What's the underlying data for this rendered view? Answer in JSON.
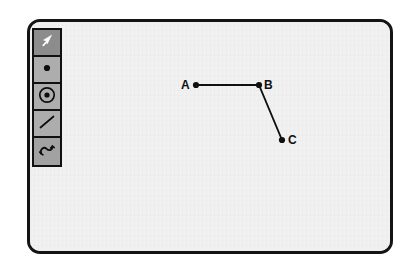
{
  "app": {
    "window_name": "geometry-sketch-window",
    "canvas_name": "drawing-canvas",
    "canvas_bg": "#f1f1f1",
    "border_color": "#141414"
  },
  "toolbar": {
    "name": "tool-palette",
    "active_tool": "select",
    "bg": "#b4b4b4",
    "active_bg": "#8c8c8c",
    "idle_bg": "#adadad",
    "tools": [
      {
        "id": "select",
        "icon": "arrow-cursor-icon",
        "label": "Select",
        "active": true
      },
      {
        "id": "point",
        "icon": "point-icon",
        "label": "Point",
        "active": false
      },
      {
        "id": "circle",
        "icon": "circle-icon",
        "label": "Circle",
        "active": false
      },
      {
        "id": "segment",
        "icon": "line-icon",
        "label": "Segment",
        "active": false
      },
      {
        "id": "curve",
        "icon": "curve-icon",
        "label": "Curve",
        "active": false
      }
    ]
  },
  "sketch": {
    "points": [
      {
        "id": "A",
        "label": "A",
        "x": 196,
        "y": 85,
        "label_x": 181,
        "label_y": 79
      },
      {
        "id": "B",
        "label": "B",
        "x": 259,
        "y": 85,
        "label_x": 264,
        "label_y": 79
      },
      {
        "id": "C",
        "label": "C",
        "x": 282,
        "y": 140,
        "label_x": 288,
        "label_y": 134
      }
    ],
    "segments": [
      {
        "id": "AB",
        "from": "A",
        "to": "B"
      },
      {
        "id": "BC",
        "from": "B",
        "to": "C"
      }
    ],
    "stroke_color": "#101010",
    "point_color": "#101010"
  }
}
